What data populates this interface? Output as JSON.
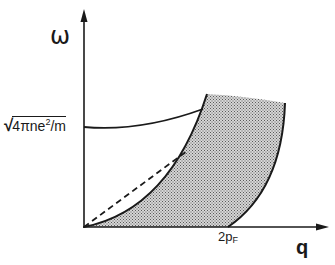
{
  "diagram": {
    "axes": {
      "y_label": "ω",
      "x_label": "q"
    },
    "annotations": {
      "plasma_frequency": {
        "radical": "√",
        "radicand_pre": "4πne",
        "radicand_sup": "2",
        "radicand_post": "/m"
      },
      "fermi_momentum": {
        "main": "2p",
        "sub": "F"
      }
    },
    "curves": [
      {
        "name": "plasmon-dispersion",
        "style": "solid",
        "description": "starts at ω = √(4πne²/m) at q=0 and rises until it meets the continuum"
      },
      {
        "name": "continuum-upper-boundary",
        "style": "solid",
        "description": "parabolic upper edge of particle-hole continuum starting at origin"
      },
      {
        "name": "continuum-lower-boundary",
        "style": "solid",
        "description": "lower edge starting at q = 2p_F"
      },
      {
        "name": "linear-approximation",
        "style": "dashed",
        "description": "straight dashed line from origin to upper boundary"
      }
    ],
    "regions": [
      {
        "name": "particle-hole-continuum",
        "fill": "stippled-gray"
      }
    ],
    "colors": {
      "ink": "#1a1a1a",
      "fill": "#b8b8b8",
      "background": "#ffffff"
    }
  }
}
